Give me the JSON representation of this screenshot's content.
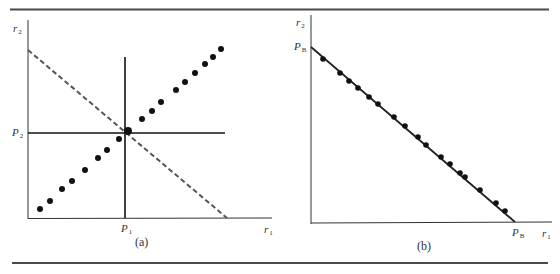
{
  "figure": {
    "panels": [
      {
        "id": "a",
        "caption": "(a)",
        "y_axis_label": {
          "base": "r",
          "sub": "2"
        },
        "x_axis_label": {
          "base": "r",
          "sub": "1"
        },
        "x_tick_label": {
          "base": "P",
          "sub": "1"
        },
        "y_tick_label": {
          "base": "P",
          "sub": "2"
        },
        "elements": [
          "dotted upward-sloping line of points",
          "dashed downward-sloping line",
          "vertical line at P1",
          "horizontal line at P2"
        ]
      },
      {
        "id": "b",
        "caption": "(b)",
        "y_axis_label": {
          "base": "r",
          "sub": "2"
        },
        "x_axis_label": {
          "base": "r",
          "sub": "1"
        },
        "x_tick_label": {
          "base": "P",
          "sub": "B"
        },
        "y_tick_label": {
          "base": "P",
          "sub": "B"
        },
        "elements": [
          "solid downward-sloping line from (0,PB) to (PB,0)",
          "points lying on the line"
        ]
      }
    ],
    "colors": {
      "ink": "#1a1a1a",
      "dashed": "#555555",
      "rule": "#4a4a4a"
    }
  },
  "chart_data": [
    {
      "type": "scatter",
      "title": "(a)",
      "xlabel": "r1",
      "ylabel": "r2",
      "x_ticks": [
        "P1"
      ],
      "y_ticks": [
        "P2"
      ],
      "points_px": [
        [
          40,
          209
        ],
        [
          50,
          201
        ],
        [
          62,
          189
        ],
        [
          72,
          181
        ],
        [
          85,
          170
        ],
        [
          98,
          158
        ],
        [
          107,
          150
        ],
        [
          119,
          139
        ],
        [
          128,
          131
        ],
        [
          142,
          119
        ],
        [
          152,
          111
        ],
        [
          161,
          102
        ],
        [
          176,
          90
        ],
        [
          185,
          82
        ],
        [
          195,
          73
        ],
        [
          205,
          64
        ],
        [
          213,
          57
        ],
        [
          221,
          49
        ]
      ],
      "dashed_line_px": [
        [
          28,
          50
        ],
        [
          227,
          218
        ]
      ],
      "vertical_line_px": [
        [
          125,
          57
        ],
        [
          125,
          218
        ]
      ],
      "horizontal_line_px": [
        [
          28,
          133
        ],
        [
          225,
          133
        ]
      ],
      "grid": false
    },
    {
      "type": "scatter",
      "title": "(b)",
      "xlabel": "r1",
      "ylabel": "r2",
      "x_ticks": [
        "PB"
      ],
      "y_ticks": [
        "PB"
      ],
      "points_px": [
        [
          323,
          59
        ],
        [
          340,
          73
        ],
        [
          349,
          81
        ],
        [
          358,
          88
        ],
        [
          369,
          97
        ],
        [
          378,
          104
        ],
        [
          394,
          117
        ],
        [
          405,
          126
        ],
        [
          418,
          137
        ],
        [
          426,
          145
        ],
        [
          441,
          157
        ],
        [
          450,
          164
        ],
        [
          460,
          173
        ],
        [
          465,
          177
        ],
        [
          480,
          190
        ],
        [
          496,
          203
        ],
        [
          505,
          211
        ]
      ],
      "solid_line_px": [
        [
          311,
          47
        ],
        [
          515,
          222
        ]
      ],
      "grid": false
    }
  ]
}
